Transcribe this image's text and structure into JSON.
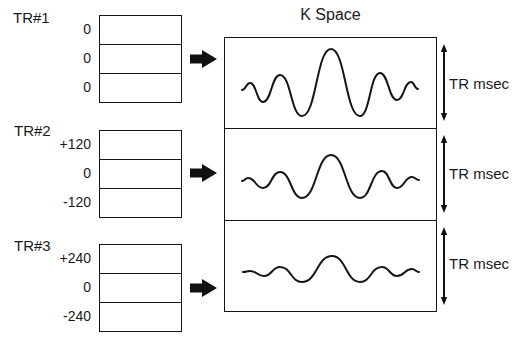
{
  "kspace": {
    "title": "K Space",
    "duration_label": "TR msec"
  },
  "repetitions": [
    {
      "label": "TR#1",
      "phase_gradients": [
        "0",
        "0",
        "0"
      ],
      "waveform": [
        [
          18,
          53
        ],
        [
          26,
          46
        ],
        [
          39,
          65
        ],
        [
          56,
          38
        ],
        [
          78,
          79
        ],
        [
          107,
          12
        ],
        [
          136,
          79
        ],
        [
          156,
          36
        ],
        [
          173,
          63
        ],
        [
          187,
          45
        ],
        [
          194,
          52
        ]
      ]
    },
    {
      "label": "TR#2",
      "phase_gradients": [
        "+120",
        "0",
        "-120"
      ],
      "waveform": [
        [
          18,
          53
        ],
        [
          24,
          50
        ],
        [
          39,
          60
        ],
        [
          56,
          44
        ],
        [
          78,
          70
        ],
        [
          107,
          27
        ],
        [
          136,
          70
        ],
        [
          158,
          43
        ],
        [
          173,
          60
        ],
        [
          188,
          49
        ],
        [
          195,
          52
        ]
      ]
    },
    {
      "label": "TR#3",
      "phase_gradients": [
        "+240",
        "0",
        "-240"
      ],
      "waveform": [
        [
          19,
          53
        ],
        [
          26,
          52
        ],
        [
          40,
          57
        ],
        [
          56,
          48
        ],
        [
          78,
          63
        ],
        [
          108,
          37
        ],
        [
          136,
          63
        ],
        [
          158,
          48
        ],
        [
          173,
          57
        ],
        [
          188,
          50
        ],
        [
          195,
          53
        ]
      ]
    }
  ],
  "colors": {
    "line": "#151515",
    "text": "#1a1a1a",
    "background": "#ffffff"
  }
}
